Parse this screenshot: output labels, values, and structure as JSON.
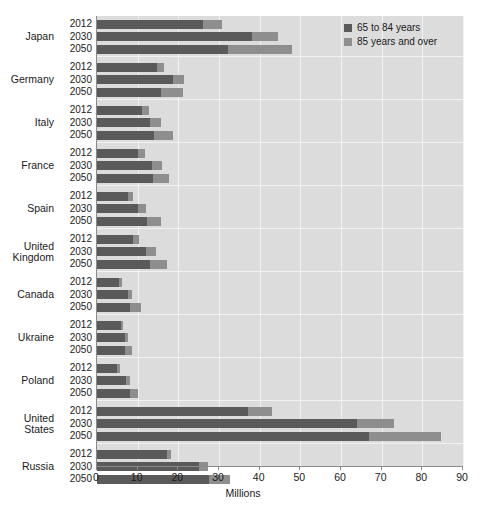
{
  "chart_data": {
    "type": "bar",
    "orientation": "horizontal",
    "stacked": true,
    "title": "",
    "xlabel": "Millions",
    "ylabel": "",
    "xlim": [
      0,
      90
    ],
    "xticks": [
      0,
      10,
      20,
      30,
      40,
      50,
      60,
      70,
      80,
      90
    ],
    "grid": true,
    "legend_position": "top-right",
    "colors": {
      "series_65_84": "#5a5a5a",
      "series_85_over": "#8e8e8e",
      "plot_background": "#dcdcdc",
      "gridline": "#f2f2f2",
      "axis": "#8a8a8a",
      "text": "#1a1a1a"
    },
    "legend": [
      {
        "label": "65 to 84 years",
        "color": "#5a5a5a"
      },
      {
        "label": "85 years and over",
        "color": "#8e8e8e"
      }
    ],
    "series": [
      {
        "name": "65 to 84 years"
      },
      {
        "name": "85 years and over"
      }
    ],
    "groups": [
      {
        "country": "Japan",
        "rows": [
          {
            "year": "2012",
            "values": [
              26.0,
              4.7
            ],
            "total": 30.7
          },
          {
            "year": "2030",
            "values": [
              38.2,
              6.3
            ],
            "total": 44.5
          },
          {
            "year": "2050",
            "values": [
              32.2,
              15.8
            ],
            "total": 48.0
          }
        ]
      },
      {
        "country": "Germany",
        "rows": [
          {
            "year": "2012",
            "values": [
              14.7,
              1.8
            ],
            "total": 16.5
          },
          {
            "year": "2030",
            "values": [
              18.7,
              2.8
            ],
            "total": 21.5
          },
          {
            "year": "2050",
            "values": [
              15.8,
              5.3
            ],
            "total": 21.1
          }
        ]
      },
      {
        "country": "Italy",
        "rows": [
          {
            "year": "2012",
            "values": [
              11.1,
              1.7
            ],
            "total": 12.8
          },
          {
            "year": "2030",
            "values": [
              13.1,
              2.6
            ],
            "total": 15.7
          },
          {
            "year": "2050",
            "values": [
              13.9,
              4.8
            ],
            "total": 18.7
          }
        ]
      },
      {
        "country": "France",
        "rows": [
          {
            "year": "2012",
            "values": [
              10.1,
              1.8
            ],
            "total": 11.9
          },
          {
            "year": "2030",
            "values": [
              13.5,
              2.5
            ],
            "total": 16.0
          },
          {
            "year": "2050",
            "values": [
              13.7,
              4.0
            ],
            "total": 17.7
          }
        ]
      },
      {
        "country": "Spain",
        "rows": [
          {
            "year": "2012",
            "values": [
              7.6,
              1.2
            ],
            "total": 8.8
          },
          {
            "year": "2030",
            "values": [
              10.2,
              1.8
            ],
            "total": 12.0
          },
          {
            "year": "2050",
            "values": [
              12.2,
              3.6
            ],
            "total": 15.8
          }
        ]
      },
      {
        "country": "United\nKingdom",
        "rows": [
          {
            "year": "2012",
            "values": [
              8.8,
              1.5
            ],
            "total": 10.3
          },
          {
            "year": "2030",
            "values": [
              12.1,
              2.3
            ],
            "total": 14.4
          },
          {
            "year": "2050",
            "values": [
              13.1,
              4.1
            ],
            "total": 17.2
          }
        ]
      },
      {
        "country": "Canada",
        "rows": [
          {
            "year": "2012",
            "values": [
              5.4,
              0.8
            ],
            "total": 6.2
          },
          {
            "year": "2030",
            "values": [
              7.5,
              1.1
            ],
            "total": 8.6
          },
          {
            "year": "2050",
            "values": [
              8.2,
              2.6
            ],
            "total": 10.8
          }
        ]
      },
      {
        "country": "Ukraine",
        "rows": [
          {
            "year": "2012",
            "values": [
              6.0,
              0.4
            ],
            "total": 6.4
          },
          {
            "year": "2030",
            "values": [
              6.9,
              0.8
            ],
            "total": 7.7
          },
          {
            "year": "2050",
            "values": [
              7.0,
              1.5
            ],
            "total": 8.5
          }
        ]
      },
      {
        "country": "Poland",
        "rows": [
          {
            "year": "2012",
            "values": [
              5.0,
              0.6
            ],
            "total": 5.6
          },
          {
            "year": "2030",
            "values": [
              7.2,
              0.9
            ],
            "total": 8.1
          },
          {
            "year": "2050",
            "values": [
              8.0,
              2.1
            ],
            "total": 10.1
          }
        ]
      },
      {
        "country": "United\nStates",
        "rows": [
          {
            "year": "2012",
            "values": [
              37.2,
              5.9
            ],
            "total": 43.1
          },
          {
            "year": "2030",
            "values": [
              63.9,
              9.1
            ],
            "total": 73.0
          },
          {
            "year": "2050",
            "values": [
              67.0,
              17.5
            ],
            "total": 84.5
          }
        ]
      },
      {
        "country": "Russia",
        "rows": [
          {
            "year": "2012",
            "values": [
              17.3,
              1.0
            ],
            "total": 18.3
          },
          {
            "year": "2030",
            "values": [
              25.0,
              2.2
            ],
            "total": 27.2
          },
          {
            "year": "2050",
            "values": [
              27.6,
              5.1
            ],
            "total": 32.7
          }
        ]
      }
    ]
  }
}
